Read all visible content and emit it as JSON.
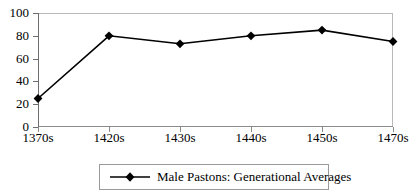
{
  "chart_data": {
    "type": "line",
    "title": "",
    "xlabel": "",
    "ylabel": "",
    "categories": [
      "1370s",
      "1420s",
      "1430s",
      "1440s",
      "1450s",
      "1470s"
    ],
    "series": [
      {
        "name": "Male Pastons: Generational Averages",
        "values": [
          25,
          80,
          73,
          80,
          85,
          75
        ]
      }
    ],
    "ylim": [
      0,
      100
    ],
    "yticks": [
      0,
      20,
      40,
      60,
      80,
      100
    ],
    "ytick_labels": [
      "0",
      "20",
      "40",
      "60",
      "80",
      "100"
    ],
    "grid": false,
    "legend_position": "bottom-center",
    "marker": "diamond",
    "colors": {
      "series_line": "#000000",
      "marker": "#000000",
      "axis": "#6e6e6e",
      "plot_border": "#b9b9b9",
      "legend_border": "#9a9a9a",
      "background": "#ffffff"
    }
  },
  "legend": {
    "entries": [
      {
        "label": "Male Pastons: Generational Averages",
        "marker_name": "diamond-marker"
      }
    ]
  },
  "axes": {
    "y": {
      "ticks": [
        "100",
        "80",
        "60",
        "40",
        "20",
        "0"
      ]
    },
    "x": {
      "ticks": [
        "1370s",
        "1420s",
        "1430s",
        "1440s",
        "1450s",
        "1470s"
      ]
    }
  }
}
